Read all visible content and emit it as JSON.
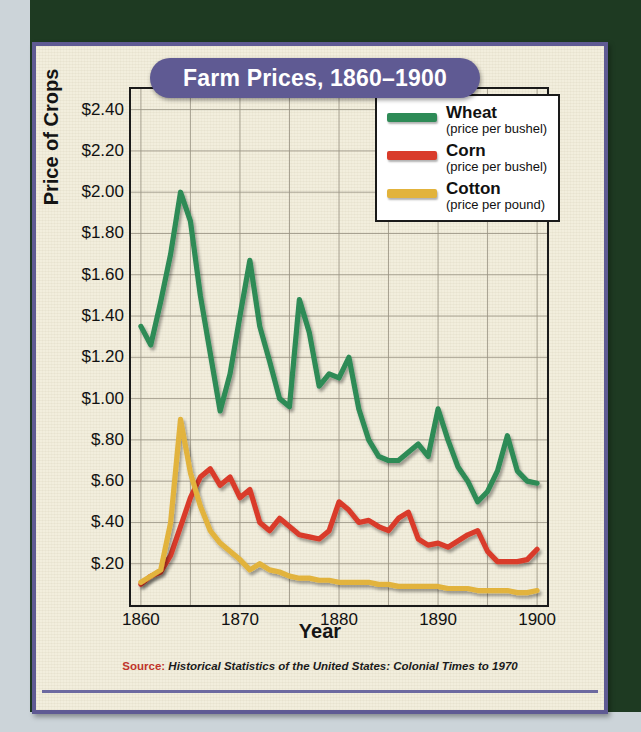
{
  "title": "Farm Prices, 1860–1900",
  "source": {
    "key": "Source:",
    "value": "Historical Statistics of the United States: Colonial Times to 1970"
  },
  "legend": {
    "items": [
      {
        "name": "Wheat",
        "sub": "(price per bushel)",
        "color": "#2e8b57"
      },
      {
        "name": "Corn",
        "sub": "(price per bushel)",
        "color": "#d93b2b"
      },
      {
        "name": "Cotton",
        "sub": "(price per pound)",
        "color": "#e2b33c"
      }
    ]
  },
  "colors": {
    "frame": "#5f5a93",
    "paper": "#f2eedd",
    "backdrop": "#1e3a22",
    "title_text": "#ffffff",
    "source_key": "#c0352b",
    "grid": "#9a9484",
    "axis": "#1a1a1a"
  },
  "chart_data": {
    "type": "line",
    "title": "Farm Prices, 1860–1900",
    "xlabel": "Year",
    "ylabel": "Price of Crops",
    "xlim": [
      1859,
      1901
    ],
    "ylim": [
      0,
      2.5
    ],
    "grid": true,
    "legend_position": "top-right",
    "xticks": [
      1860,
      1870,
      1880,
      1890,
      1900
    ],
    "xticklabels": [
      "1860",
      "1870",
      "1880",
      "1890",
      "1900"
    ],
    "yticks": [
      0.2,
      0.4,
      0.6,
      0.8,
      1.0,
      1.2,
      1.4,
      1.6,
      1.8,
      2.0,
      2.2,
      2.4
    ],
    "yticklabels": [
      "$.20",
      "$.40",
      "$.60",
      "$.80",
      "$1.00",
      "$1.20",
      "$1.40",
      "$1.60",
      "$1.80",
      "$2.00",
      "$2.20",
      "$2.40"
    ],
    "x": [
      1860,
      1861,
      1862,
      1863,
      1864,
      1865,
      1866,
      1867,
      1868,
      1869,
      1870,
      1871,
      1872,
      1873,
      1874,
      1875,
      1876,
      1877,
      1878,
      1879,
      1880,
      1881,
      1882,
      1883,
      1884,
      1885,
      1886,
      1887,
      1888,
      1889,
      1890,
      1891,
      1892,
      1893,
      1894,
      1895,
      1896,
      1897,
      1898,
      1899,
      1900
    ],
    "series": [
      {
        "name": "Wheat",
        "unit": "price per bushel",
        "color": "#2e8b57",
        "values": [
          1.35,
          1.26,
          1.47,
          1.7,
          2.0,
          1.86,
          1.5,
          1.22,
          0.94,
          1.12,
          1.4,
          1.67,
          1.35,
          1.18,
          1.0,
          0.96,
          1.48,
          1.32,
          1.06,
          1.12,
          1.1,
          1.2,
          0.95,
          0.8,
          0.72,
          0.7,
          0.7,
          0.74,
          0.78,
          0.72,
          0.95,
          0.8,
          0.67,
          0.6,
          0.5,
          0.55,
          0.65,
          0.82,
          0.65,
          0.6,
          0.59
        ]
      },
      {
        "name": "Corn",
        "unit": "price per bushel",
        "color": "#d93b2b",
        "values": [
          0.1,
          0.14,
          0.16,
          0.24,
          0.38,
          0.52,
          0.62,
          0.66,
          0.58,
          0.62,
          0.52,
          0.56,
          0.4,
          0.36,
          0.42,
          0.38,
          0.34,
          0.33,
          0.32,
          0.36,
          0.5,
          0.46,
          0.4,
          0.41,
          0.38,
          0.36,
          0.42,
          0.45,
          0.32,
          0.29,
          0.3,
          0.28,
          0.31,
          0.34,
          0.36,
          0.26,
          0.21,
          0.21,
          0.21,
          0.22,
          0.27
        ]
      },
      {
        "name": "Cotton",
        "unit": "price per pound",
        "color": "#e2b33c",
        "values": [
          0.11,
          0.14,
          0.17,
          0.4,
          0.9,
          0.64,
          0.48,
          0.36,
          0.3,
          0.26,
          0.22,
          0.17,
          0.2,
          0.17,
          0.16,
          0.14,
          0.13,
          0.13,
          0.12,
          0.12,
          0.11,
          0.11,
          0.11,
          0.11,
          0.1,
          0.1,
          0.09,
          0.09,
          0.09,
          0.09,
          0.09,
          0.08,
          0.08,
          0.08,
          0.07,
          0.07,
          0.07,
          0.07,
          0.06,
          0.06,
          0.07
        ]
      }
    ]
  }
}
